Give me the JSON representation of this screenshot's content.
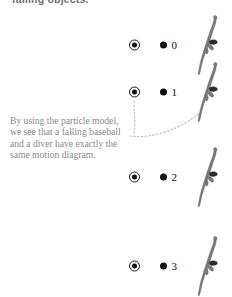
{
  "figure": {
    "header": {
      "text": "falling objects."
    },
    "caption": {
      "lines": [
        "By using the particle model,",
        "we see that a falling baseball",
        "and a diver have exactly the",
        "same motion diagram."
      ]
    },
    "columns": {
      "ball_label": "falling-baseball",
      "dot_label": "particle-model-dot",
      "diver_label": "diver-photo"
    },
    "rows": [
      {
        "index": "0",
        "y": 45
      },
      {
        "index": "1",
        "y": 92
      },
      {
        "index": "2",
        "y": 177
      },
      {
        "index": "3",
        "y": 266
      }
    ],
    "colors": {
      "ink": "#111111",
      "caption_gray": "#8a8a8a",
      "header_gray": "#6f6f6f",
      "leader_gray": "#b4b4b4",
      "diver_gray": "#6b6b6b",
      "background": "#ffffff"
    }
  }
}
